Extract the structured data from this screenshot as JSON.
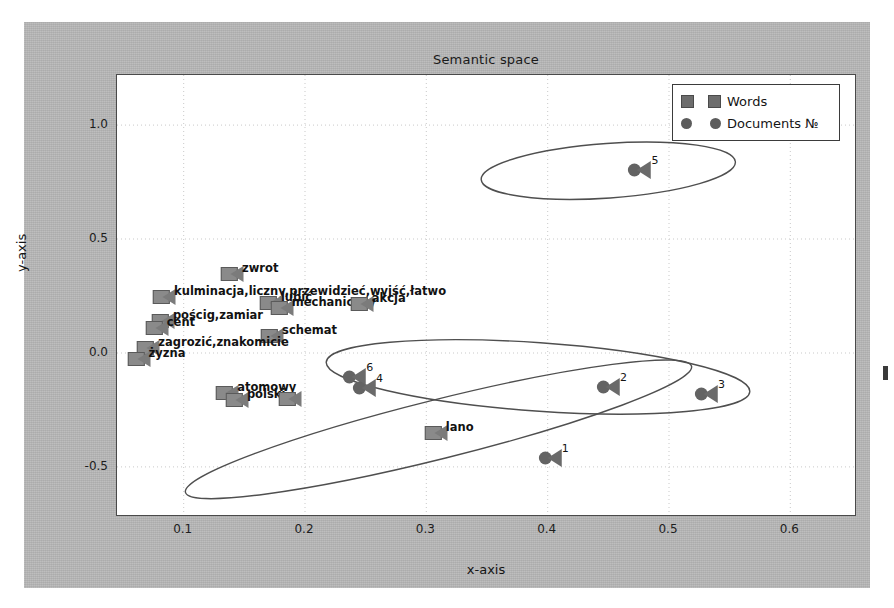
{
  "chart_data": {
    "type": "scatter",
    "title": "Semantic space",
    "xlabel": "x-axis",
    "ylabel": "y-axis",
    "xlim": [
      0.045,
      0.655
    ],
    "ylim": [
      -0.72,
      1.22
    ],
    "xticks": [
      "0.1",
      "0.2",
      "0.3",
      "0.4",
      "0.5",
      "0.6"
    ],
    "xtick_values": [
      0.1,
      0.2,
      0.3,
      0.4,
      0.5,
      0.6
    ],
    "yticks": [
      "1.0",
      "0.5",
      "0.0",
      "-0.5"
    ],
    "ytick_values": [
      1.0,
      0.5,
      0.0,
      -0.5
    ],
    "grid": true,
    "legend_position": "upper right",
    "legend": [
      {
        "label": "Words",
        "marker": "square",
        "color": "#6d6d6d"
      },
      {
        "label": "Documents №",
        "marker": "circle",
        "color": "#5c5c5c"
      }
    ],
    "series": [
      {
        "name": "Words",
        "marker": "square",
        "points": [
          {
            "x": 0.139,
            "y": 0.345,
            "label": "zwrot"
          },
          {
            "x": 0.083,
            "y": 0.245,
            "label": "kulminacja,liczny,przewidzieć,wyjść,łatwo"
          },
          {
            "x": 0.171,
            "y": 0.218,
            "label": "lubić"
          },
          {
            "x": 0.18,
            "y": 0.198,
            "label": "mechaniczny"
          },
          {
            "x": 0.246,
            "y": 0.213,
            "label": "akcja"
          },
          {
            "x": 0.082,
            "y": 0.142,
            "label": "pościg,zamiar"
          },
          {
            "x": 0.077,
            "y": 0.108,
            "label": "cent"
          },
          {
            "x": 0.172,
            "y": 0.075,
            "label": "schemat"
          },
          {
            "x": 0.07,
            "y": 0.02,
            "label": "zagrozić,znakomicie"
          },
          {
            "x": 0.062,
            "y": -0.028,
            "label": "żyzna"
          },
          {
            "x": 0.135,
            "y": -0.175,
            "label": "atomowy"
          },
          {
            "x": 0.143,
            "y": -0.205,
            "label": "polski"
          },
          {
            "x": 0.187,
            "y": -0.203,
            "label": ""
          },
          {
            "x": 0.307,
            "y": -0.352,
            "label": "lano"
          }
        ]
      },
      {
        "name": "Documents №",
        "marker": "circle",
        "points": [
          {
            "x": 0.474,
            "y": 0.805,
            "num": "5"
          },
          {
            "x": 0.448,
            "y": -0.15,
            "num": "2"
          },
          {
            "x": 0.529,
            "y": -0.178,
            "num": "3"
          },
          {
            "x": 0.239,
            "y": -0.105,
            "num": "6"
          },
          {
            "x": 0.247,
            "y": -0.152,
            "num": "4"
          },
          {
            "x": 0.4,
            "y": -0.46,
            "num": "1"
          }
        ]
      }
    ],
    "clusters": [
      {
        "name": "cluster-top",
        "cx": 0.45,
        "cy": 0.8,
        "rx": 0.105,
        "ry": 0.12,
        "rot": -4
      },
      {
        "name": "cluster-middle",
        "cx": 0.392,
        "cy": -0.105,
        "rx": 0.175,
        "ry": 0.15,
        "rot": 4
      },
      {
        "name": "cluster-bottom",
        "cx": 0.31,
        "cy": -0.335,
        "rx": 0.215,
        "ry": 0.13,
        "rot": -14
      }
    ]
  }
}
